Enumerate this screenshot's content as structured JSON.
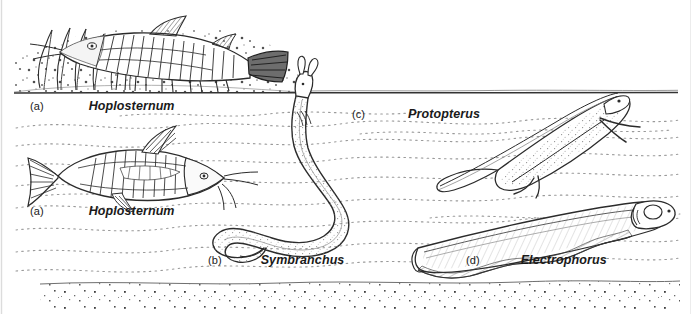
{
  "figure": {
    "width": 692,
    "height": 314,
    "background_color": "#ffffff",
    "ink_color": "#1a1a1a",
    "line_color": "#2b2b2b",
    "water_line_color": "#333333",
    "dotted_current_color": "#999999",
    "substrate_speckle_color": "#555555"
  },
  "panels": [
    {
      "key": "a-top",
      "tag": "(a)",
      "genus": "Hoplosternum",
      "position": {
        "x": 30,
        "y": 97
      },
      "scene": "armoured catfish resting on a speckled sandy bottom among vertical plant stems, above the water-surface line"
    },
    {
      "key": "a-bottom",
      "tag": "(a)",
      "genus": "Hoplosternum",
      "position": {
        "x": 30,
        "y": 202
      },
      "scene": "armoured catfish with barbels swimming in midwater below the surface"
    },
    {
      "key": "b",
      "tag": "(b)",
      "genus": "Symbranchus",
      "position": {
        "x": 208,
        "y": 251
      },
      "scene": "swamp eel in an S-curve with its head breaking the water surface to gulp air"
    },
    {
      "key": "c",
      "tag": "(c)",
      "genus": "Protopterus",
      "position": {
        "x": 352,
        "y": 105
      },
      "scene": "African lungfish angled head-up to the surface with thin filamentous paired fins"
    },
    {
      "key": "d",
      "tag": "(d)",
      "genus": "Electrophorus",
      "position": {
        "x": 466,
        "y": 251
      },
      "scene": "electric eel lying nearly horizontal with a long undulating anal fin, head to the right"
    }
  ],
  "scene_elements": {
    "water_surface_label": "water surface line",
    "substrate_label": "sandy speckled bottom",
    "current_lines_label": "dotted wavy water current lines",
    "plants_label": "vertical aquatic plant stems"
  }
}
